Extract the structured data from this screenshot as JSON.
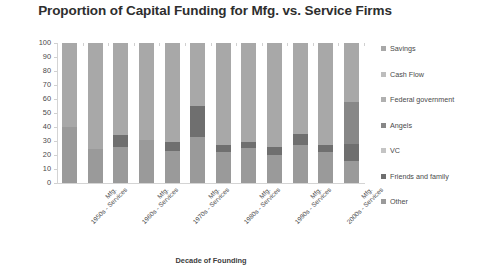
{
  "chart_data": {
    "type": "bar",
    "subtype": "stacked-column-100",
    "title": "Proportion of Capital Funding for Mfg. vs. Service Firms",
    "xlabel": "Decade of Founding",
    "ylabel": "% of Capital Coming from Each Source",
    "ylim": [
      0,
      100
    ],
    "yticks": [
      0,
      10,
      20,
      30,
      40,
      50,
      60,
      70,
      80,
      90,
      100
    ],
    "ytick_labels": [
      "0",
      "10",
      "20",
      "30",
      "40",
      "50",
      "60",
      "70",
      "80",
      "90",
      "100"
    ],
    "grid": false,
    "legend_position": "right",
    "categories": [
      "1950s - Services",
      "Mfg.",
      "1960s - Services",
      "Mfg.",
      "1970s - Services",
      "Mfg.",
      "1980s - Services",
      "Mfg.",
      "1990s - Services",
      "Mfg.",
      "2000s - Services",
      "Mfg."
    ],
    "series": [
      {
        "name": "Other",
        "color": "#9a9a9a",
        "values": [
          40,
          24,
          26,
          31,
          23,
          33,
          22,
          25,
          20,
          27,
          22,
          16
        ]
      },
      {
        "name": "Friends and family",
        "color": "#6f6f6f",
        "values": [
          0,
          0,
          8,
          0,
          6,
          22,
          5,
          4,
          6,
          8,
          5,
          12
        ]
      },
      {
        "name": "VC",
        "color": "#c4c4c4",
        "values": [
          0,
          0,
          0,
          0,
          0,
          0,
          0,
          0,
          0,
          0,
          0,
          0
        ]
      },
      {
        "name": "Angels",
        "color": "#878787",
        "values": [
          0,
          0,
          0,
          0,
          0,
          0,
          0,
          0,
          0,
          0,
          0,
          30
        ]
      },
      {
        "name": "Federal government",
        "color": "#b0b0b0",
        "values": [
          0,
          0,
          0,
          0,
          0,
          0,
          0,
          0,
          0,
          0,
          0,
          0
        ]
      },
      {
        "name": "Cash Flow",
        "color": "#bdbdbd",
        "values": [
          0,
          0,
          0,
          0,
          0,
          0,
          0,
          0,
          0,
          0,
          0,
          0
        ]
      },
      {
        "name": "Savings",
        "color": "#a8a8a8",
        "values": [
          60,
          76,
          66,
          69,
          71,
          45,
          73,
          71,
          74,
          65,
          73,
          42
        ]
      }
    ],
    "legend_entries": [
      {
        "label": "Savings",
        "color": "#a8a8a8"
      },
      {
        "label": "Cash Flow",
        "color": "#bdbdbd"
      },
      {
        "label": "Federal government",
        "color": "#b0b0b0"
      },
      {
        "label": "Angels",
        "color": "#878787"
      },
      {
        "label": "VC",
        "color": "#c4c4c4"
      },
      {
        "label": "Friends and family",
        "color": "#6f6f6f"
      },
      {
        "label": "Other",
        "color": "#9a9a9a"
      }
    ]
  }
}
